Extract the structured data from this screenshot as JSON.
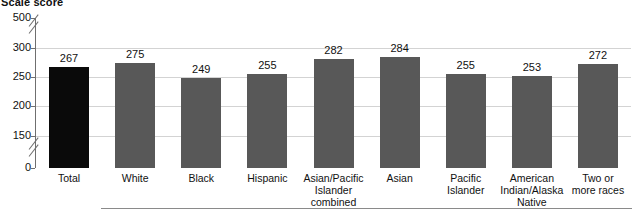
{
  "chart_data": {
    "type": "bar",
    "title": "Scale score",
    "xlabel": "",
    "ylabel": "",
    "categories": [
      "Total",
      "White",
      "Black",
      "Hispanic",
      "Asian/Pacific Islander combined",
      "Asian",
      "Pacific Islander",
      "American Indian/Alaska Native",
      "Two or more races"
    ],
    "values": [
      267,
      275,
      249,
      255,
      282,
      284,
      255,
      253,
      272
    ],
    "ylim": [
      0,
      500
    ],
    "yticks": [
      500,
      300,
      250,
      200,
      150,
      0
    ],
    "ytick_labels": [
      "500",
      "300",
      "250",
      "200",
      "150",
      "0"
    ],
    "axis_breaks": [
      "between 500 and 300",
      "between 150 and 0"
    ],
    "grid": true,
    "legend": "none",
    "bar_colors": [
      "#0a0a0a",
      "#585858",
      "#585858",
      "#585858",
      "#585858",
      "#585858",
      "#585858",
      "#585858",
      "#585858"
    ],
    "highlight_color": "#0a0a0a",
    "series_color": "#585858",
    "gridline_color": "#d3d3d3",
    "axis_color": "#6f6f6f"
  },
  "axis": {
    "y_ticks": [
      {
        "label": "500",
        "value": 500
      },
      {
        "label": "300",
        "value": 300
      },
      {
        "label": "250",
        "value": 250
      },
      {
        "label": "200",
        "value": 200
      },
      {
        "label": "150",
        "value": 150
      },
      {
        "label": "0",
        "value": 0
      }
    ]
  },
  "bars": [
    {
      "label": "Total",
      "label_lines": [
        "Total"
      ],
      "value": 267,
      "value_label": "267",
      "color": "#0a0a0a"
    },
    {
      "label": "White",
      "label_lines": [
        "White"
      ],
      "value": 275,
      "value_label": "275",
      "color": "#585858"
    },
    {
      "label": "Black",
      "label_lines": [
        "Black"
      ],
      "value": 249,
      "value_label": "249",
      "color": "#585858"
    },
    {
      "label": "Hispanic",
      "label_lines": [
        "Hispanic"
      ],
      "value": 255,
      "value_label": "255",
      "color": "#585858"
    },
    {
      "label": "Asian/Pacific Islander combined",
      "label_lines": [
        "Asian/Pacific",
        "Islander",
        "combined"
      ],
      "value": 282,
      "value_label": "282",
      "color": "#585858"
    },
    {
      "label": "Asian",
      "label_lines": [
        "Asian"
      ],
      "value": 284,
      "value_label": "284",
      "color": "#585858"
    },
    {
      "label": "Pacific Islander",
      "label_lines": [
        "Pacific",
        "Islander"
      ],
      "value": 255,
      "value_label": "255",
      "color": "#585858"
    },
    {
      "label": "American Indian/Alaska Native",
      "label_lines": [
        "American",
        "Indian/Alaska",
        "Native"
      ],
      "value": 253,
      "value_label": "253",
      "color": "#585858"
    },
    {
      "label": "Two or more races",
      "label_lines": [
        "Two or",
        "more races"
      ],
      "value": 272,
      "value_label": "272",
      "color": "#585858"
    }
  ]
}
